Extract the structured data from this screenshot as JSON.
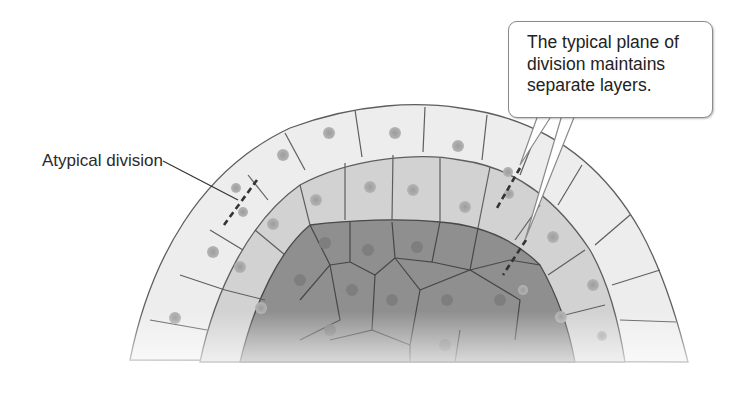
{
  "labels": {
    "atypical": "Atypical division",
    "callout": "The typical plane of\ndivision maintains\nseparate layers."
  },
  "colors": {
    "outer_layer": "#ececec",
    "middle_layer": "#cfcfcf",
    "inner_core": "#8e8e8e",
    "cell_border": "#5a5a5a",
    "nucleus": "#a8a8a8",
    "text": "#222222"
  }
}
